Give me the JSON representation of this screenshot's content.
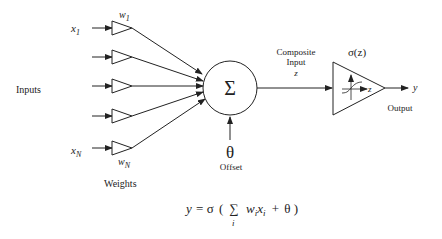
{
  "diagram": {
    "inputs_label": "Inputs",
    "weights_label": "Weights",
    "input_first": {
      "base": "x",
      "sub": "1"
    },
    "input_last": {
      "base": "x",
      "sub": "N"
    },
    "weight_first": {
      "base": "w",
      "sub": "1"
    },
    "weight_last": {
      "base": "w",
      "sub": "N"
    },
    "sum_symbol": "Σ",
    "offset_symbol": "θ",
    "offset_label": "Offset",
    "composite_label_line1": "Composite",
    "composite_label_line2": "Input",
    "composite_var": "z",
    "activation_label": "σ(z)",
    "activation_axis_var": "z",
    "output_var": "y",
    "output_label": "Output",
    "input_count_shown": 5,
    "formula": {
      "lhs": "y",
      "eq": "=",
      "sigma": "σ",
      "open": "(",
      "sum": "∑",
      "sum_index": "i",
      "w": "w",
      "w_sub": "i",
      "x": "x",
      "x_sub": "i",
      "plus": "+",
      "theta": "θ",
      "close": ")"
    },
    "colors": {
      "stroke": "#222222",
      "background": "#ffffff"
    }
  }
}
